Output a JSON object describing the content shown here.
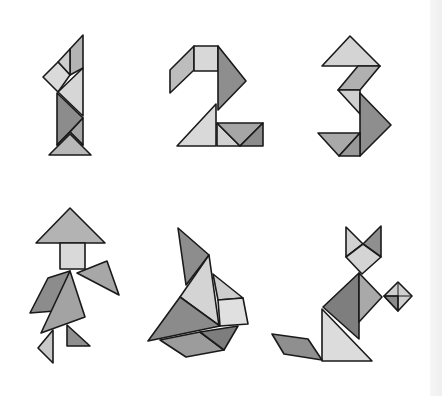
{
  "colors": {
    "background": "#ffffff",
    "light": "#d9d9d9",
    "mid": "#b4b4b4",
    "dark": "#8c8c8c",
    "darker": "#7a7a7a",
    "outline": "#1a1a1a"
  },
  "figures": [
    {
      "id": "one",
      "label": "Number 1"
    },
    {
      "id": "two",
      "label": "Number 2"
    },
    {
      "id": "three",
      "label": "Number 3"
    },
    {
      "id": "person",
      "label": "Person with hat"
    },
    {
      "id": "rabbit",
      "label": "Rabbit / bird"
    },
    {
      "id": "cat",
      "label": "Cat with ball"
    }
  ]
}
